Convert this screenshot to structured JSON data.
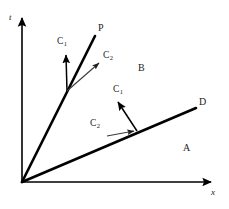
{
  "figure": {
    "background_color": "#ffffff",
    "stroke_color": "#000000",
    "thin_stroke_color": "#4a4a4a",
    "text_color": "#1a1a1a",
    "axes": {
      "t_label": "t",
      "x_label": "x",
      "origin": [
        22,
        182
      ],
      "t_axis_top": [
        22,
        15
      ],
      "x_axis_right": [
        214,
        182
      ]
    },
    "rays": [
      {
        "name": "ray-p",
        "label": "P",
        "from": [
          22,
          182
        ],
        "to": [
          95,
          36
        ],
        "label_pos": [
          98,
          27
        ]
      },
      {
        "name": "ray-d",
        "label": "D",
        "from": [
          22,
          182
        ],
        "to": [
          196,
          108
        ],
        "label_pos": [
          199,
          100
        ]
      }
    ],
    "regions": [
      {
        "name": "region-b",
        "label": "B",
        "pos": [
          138,
          68
        ]
      },
      {
        "name": "region-a",
        "label": "A",
        "pos": [
          183,
          148
        ]
      }
    ],
    "vectors": [
      {
        "name": "vector-c-upper-vertical",
        "label": "C",
        "subscript": "1",
        "from": [
          67,
          91
        ],
        "to": [
          66,
          53
        ],
        "weight": "thick",
        "label_pos": [
          58,
          40
        ]
      },
      {
        "name": "vector-c-upper-diagonal",
        "label": "C",
        "subscript": "2",
        "from": [
          67,
          91
        ],
        "to": [
          100,
          62
        ],
        "weight": "thin",
        "label_pos": [
          103,
          54
        ]
      },
      {
        "name": "vector-c-lower-diagonal",
        "label": "C",
        "subscript": "1",
        "from": [
          137,
          131
        ],
        "to": [
          117,
          100
        ],
        "weight": "thick",
        "label_pos": [
          114,
          88
        ]
      },
      {
        "name": "vector-c-lower-horizontal",
        "label": "C",
        "subscript": "2",
        "from": [
          108,
          136
        ],
        "to": [
          137,
          131
        ],
        "weight": "thin",
        "label_pos": [
          91,
          122
        ]
      }
    ]
  }
}
